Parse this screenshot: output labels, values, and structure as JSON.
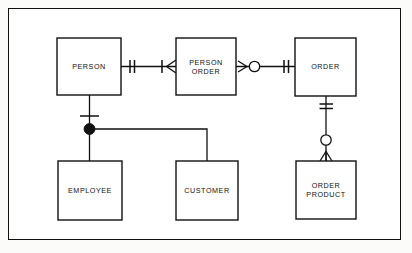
{
  "diagram": {
    "notation": "crow's-foot",
    "frame": {
      "x": 8,
      "y": 8,
      "width": 393,
      "height": 232,
      "border_color": "#111111"
    },
    "background_color": "#ffffff",
    "line_color": "#111111",
    "entities": [
      {
        "id": "person",
        "label": "PERSON",
        "lines": [
          "PERSON"
        ],
        "x": 57,
        "y": 38,
        "width": 64,
        "height": 57
      },
      {
        "id": "person-order",
        "label": "PERSON ORDER",
        "lines": [
          "PERSON",
          "ORDER"
        ],
        "x": 176,
        "y": 38,
        "width": 60,
        "height": 57
      },
      {
        "id": "order",
        "label": "ORDER",
        "lines": [
          "ORDER"
        ],
        "x": 295,
        "y": 38,
        "width": 61,
        "height": 58
      },
      {
        "id": "employee",
        "label": "EMPLOYEE",
        "lines": [
          "EMPLOYEE"
        ],
        "x": 58,
        "y": 161,
        "width": 64,
        "height": 59
      },
      {
        "id": "customer",
        "label": "CUSTOMER",
        "lines": [
          "CUSTOMER"
        ],
        "x": 176,
        "y": 161,
        "width": 62,
        "height": 59
      },
      {
        "id": "order-product",
        "label": "ORDER PRODUCT",
        "lines": [
          "ORDER",
          "PRODUCT"
        ],
        "x": 296,
        "y": 161,
        "width": 60,
        "height": 58
      }
    ],
    "relationships": [
      {
        "id": "person-to-person-order",
        "from": "person",
        "to": "person-order",
        "from_cardinality": "one-and-only-one",
        "to_cardinality": "one-or-many",
        "from_marker": "double-tick",
        "to_marker": "tick-plus-crowsfoot"
      },
      {
        "id": "person-order-to-order",
        "from": "person-order",
        "to": "order",
        "from_cardinality": "zero-or-many",
        "to_cardinality": "one-and-only-one",
        "from_marker": "crowsfoot-plus-circle",
        "to_marker": "double-tick"
      },
      {
        "id": "order-to-order-product",
        "from": "order",
        "to": "order-product",
        "from_cardinality": "one-and-only-one",
        "to_cardinality": "zero-or-many",
        "from_marker": "double-tick",
        "to_marker": "circle-plus-crowsfoot"
      },
      {
        "id": "person-subtype-employee",
        "from": "person",
        "to": "employee",
        "from_cardinality": "one-and-only-one",
        "to_marker": "subtype-dot",
        "from_marker": "single-tick"
      },
      {
        "id": "person-subtype-customer",
        "from": "person",
        "to": "customer",
        "from_cardinality": "one-and-only-one",
        "to_marker": "subtype-dot",
        "from_marker": "single-tick"
      }
    ],
    "symbols": {
      "double-tick": "one-and-only-one",
      "single-tick": "one",
      "crowsfoot": "many",
      "open-circle": "zero-optional",
      "filled-dot": "subtype-discriminator"
    }
  }
}
